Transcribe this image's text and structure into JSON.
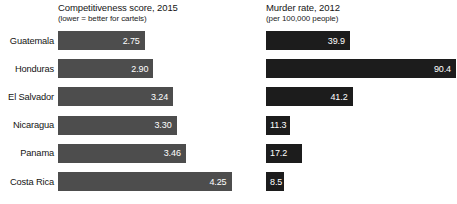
{
  "chart_data": {
    "type": "bar",
    "orientation": "horizontal",
    "title": "",
    "categories": [
      "Guatemala",
      "Honduras",
      "El Salvador",
      "Nicaragua",
      "Panama",
      "Costa Rica"
    ],
    "grid": false,
    "legend_position": "none",
    "panels": [
      {
        "key": "competitiveness",
        "title": "Competitiveness score, 2015",
        "subtitle": "(lower = better for cartels)",
        "xlabel": "",
        "ylabel": "",
        "bar_color": "#4d4d4d",
        "value_color": "#ffffff",
        "xlim": [
          1.25,
          4.5
        ],
        "values": [
          2.75,
          2.9,
          3.24,
          3.3,
          3.46,
          4.25
        ],
        "value_labels": [
          "2.75",
          "2.90",
          "3.24",
          "3.30",
          "3.46",
          "4.25"
        ]
      },
      {
        "key": "murder_rate",
        "title": "Murder rate, 2012",
        "subtitle": "(per 100,000 people)",
        "xlabel": "",
        "ylabel": "",
        "bar_color": "#1c1c1c",
        "value_color": "#ffffff",
        "xlim": [
          0,
          90.4
        ],
        "values": [
          39.9,
          90.4,
          41.2,
          11.3,
          17.2,
          8.5
        ],
        "value_labels": [
          "39.9",
          "90.4",
          "41.2",
          "11.3",
          "17.2",
          "8.5"
        ]
      }
    ]
  },
  "rows": [
    {
      "label": "Guatemala",
      "competitiveness": "2.75",
      "murder_rate": "39.9"
    },
    {
      "label": "Honduras",
      "competitiveness": "2.90",
      "murder_rate": "90.4"
    },
    {
      "label": "El Salvador",
      "competitiveness": "3.24",
      "murder_rate": "41.2"
    },
    {
      "label": "Nicaragua",
      "competitiveness": "3.30",
      "murder_rate": "11.3"
    },
    {
      "label": "Panama",
      "competitiveness": "3.46",
      "murder_rate": "17.2"
    },
    {
      "label": "Costa Rica",
      "competitiveness": "4.25",
      "murder_rate": "8.5"
    }
  ],
  "headers": {
    "left": {
      "title": "Competitiveness score, 2015",
      "subtitle": "(lower = better for cartels)"
    },
    "right": {
      "title": "Murder rate, 2012",
      "subtitle": "(per 100,000 people)"
    }
  },
  "colors": {
    "competitiveness_bar": "#4d4d4d",
    "murder_bar": "#1c1c1c",
    "value_text": "#ffffff",
    "label_text": "#141414",
    "background": "#ffffff"
  }
}
